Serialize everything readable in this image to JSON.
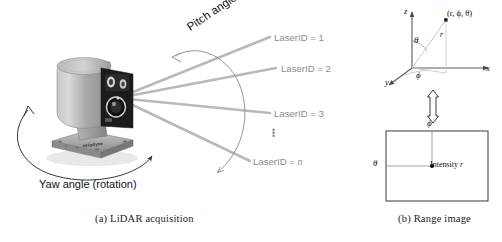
{
  "figure": {
    "type": "diagram",
    "panels": [
      {
        "tag": "(a)",
        "caption": "(a)  LiDAR acquisition"
      },
      {
        "tag": "(b)",
        "caption": "(b)  Range image"
      }
    ]
  },
  "panel_a": {
    "caption": "(a)  LiDAR acquisition",
    "device_name": "velodyne",
    "yaw_label": "Yaw angle (rotation)",
    "pitch_label": "Pitch angle",
    "beam_labels": [
      "LaserID = 1",
      "LaserID = 2",
      "LaserID = 3",
      "LaserID = "
    ],
    "beam_label_n_italic": "n",
    "ellipsis": "⋮",
    "beam_count": 4,
    "colors": {
      "beam": "#b4b4b4",
      "label_text": "#8d8d8d",
      "annotation_text": "#111111",
      "arc": "#8a8a8a",
      "device_body": "#a9a9a9",
      "device_face": "#1c1c1c"
    }
  },
  "panel_b": {
    "caption": "(b)  Range image",
    "axes": {
      "z": "z",
      "x": "x",
      "y": "y",
      "r": "r",
      "theta": "θ",
      "phi": "ϕ"
    },
    "point_label": "(r, ϕ, θ)",
    "range_image": {
      "top_axis_label": "ϕ",
      "left_axis_label": "θ",
      "pixel_label": "Intensity r",
      "pixel_label_plain": "Intensity",
      "pixel_label_italic": "r"
    },
    "link_arrow": "double-headed-vertical-arrow",
    "colors": {
      "axis": "#5a5a5a",
      "ray": "#b0b0b0",
      "box_border": "#4a4a4a",
      "text": "#111111"
    }
  }
}
